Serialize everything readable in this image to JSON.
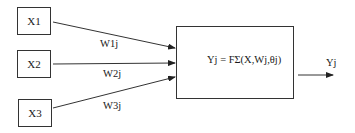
{
  "diagram": {
    "type": "neuron-model",
    "inputs": [
      {
        "id": "x1",
        "label": "X1",
        "weight": "W1j"
      },
      {
        "id": "x2",
        "label": "X2",
        "weight": "W2j"
      },
      {
        "id": "x3",
        "label": "X3",
        "weight": "W3j"
      }
    ],
    "neuron": {
      "formula": "Yj = FΣ(X,Wj,θj)"
    },
    "output": {
      "label": "Yj"
    },
    "colors": {
      "stroke": "#333333",
      "background": "#ffffff"
    }
  }
}
